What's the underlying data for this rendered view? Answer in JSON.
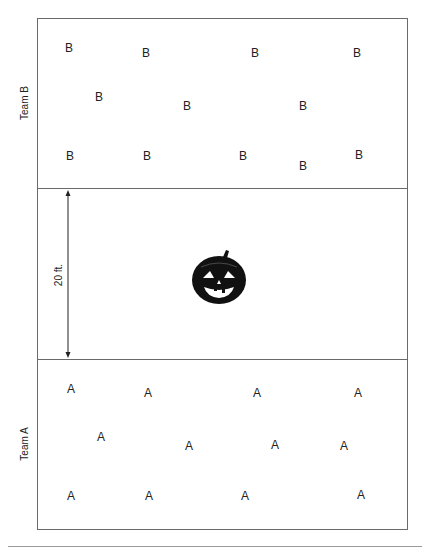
{
  "field": {
    "teams": [
      {
        "name": "Team B",
        "letter": "B",
        "label_pos": [
          24,
          103
        ],
        "players": [
          [
            69,
            48
          ],
          [
            146,
            53
          ],
          [
            255,
            53
          ],
          [
            357,
            53
          ],
          [
            99,
            97
          ],
          [
            187,
            106
          ],
          [
            303,
            106
          ],
          [
            70,
            156
          ],
          [
            147,
            156
          ],
          [
            243,
            156
          ],
          [
            303,
            166
          ],
          [
            359,
            155
          ]
        ]
      },
      {
        "name": "Team A",
        "letter": "A",
        "label_pos": [
          24,
          444
        ],
        "players": [
          [
            71,
            389
          ],
          [
            148,
            393
          ],
          [
            257,
            393
          ],
          [
            358,
            393
          ],
          [
            101,
            437
          ],
          [
            189,
            446
          ],
          [
            275,
            445
          ],
          [
            344,
            446
          ],
          [
            71,
            496
          ],
          [
            149,
            496
          ],
          [
            245,
            496
          ],
          [
            361,
            495
          ]
        ]
      }
    ],
    "center_zone": {
      "distance_label": "20 ft.",
      "arrow_x": 68,
      "arrow_top": 190,
      "arrow_bottom": 358,
      "target_icon": "jack-o-lantern-icon",
      "target_center": [
        219,
        278
      ]
    },
    "dividers_y": [
      188,
      359
    ],
    "colors": {
      "line": "#6a6a6a",
      "text": "#222222",
      "pumpkin": "#111111"
    }
  }
}
